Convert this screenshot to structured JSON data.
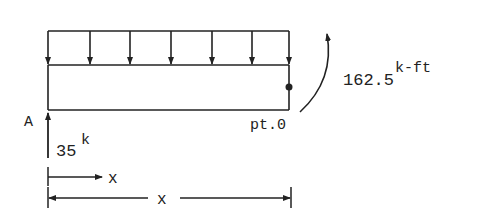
{
  "diagram": {
    "support_label": "A",
    "point_label": "pt.0",
    "reaction": {
      "value": "35",
      "unit": "k"
    },
    "moment": {
      "value": "162.5",
      "unit": "k-ft"
    },
    "x_arrow_label": "x",
    "dimension_label": "x",
    "load_arrow_count": 7,
    "stroke_color": "#222222"
  }
}
